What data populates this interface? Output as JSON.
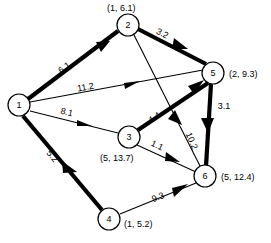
{
  "diagram": {
    "type": "directed-network-graph",
    "title": "",
    "width": 271,
    "height": 243,
    "nodes": [
      {
        "id": "1",
        "label": "1",
        "annotation": "",
        "cx": 19,
        "cy": 105,
        "r": 11
      },
      {
        "id": "2",
        "label": "2",
        "annotation": "(1, 6.1)",
        "cx": 128,
        "cy": 25,
        "r": 11
      },
      {
        "id": "3",
        "label": "3",
        "annotation": "(5, 13.7)",
        "cx": 129,
        "cy": 137,
        "r": 11
      },
      {
        "id": "4",
        "label": "4",
        "annotation": "(1, 5.2)",
        "cx": 109,
        "cy": 219,
        "r": 11
      },
      {
        "id": "5",
        "label": "5",
        "annotation": "(2, 9.3)",
        "cx": 213,
        "cy": 73,
        "r": 11
      },
      {
        "id": "6",
        "label": "6",
        "annotation": "(5, 12.4)",
        "cx": 205,
        "cy": 176,
        "r": 11
      }
    ],
    "edges": [
      {
        "from": "1",
        "to": "2",
        "weight": "6.1",
        "style": "thick",
        "label_x": 66,
        "label_y": 70
      },
      {
        "from": "2",
        "to": "5",
        "weight": "3.2",
        "style": "thick",
        "label_x": 163,
        "label_y": 38
      },
      {
        "from": "1",
        "to": "5",
        "weight": "11.2",
        "style": "thin",
        "label_x": 86,
        "label_y": 92
      },
      {
        "from": "3",
        "to": "1",
        "weight": "8.1",
        "style": "thin",
        "label_x": 66,
        "label_y": 117
      },
      {
        "from": "1",
        "to": "4",
        "weight": "5.2",
        "style": "thick",
        "label_x": 51,
        "label_y": 159
      },
      {
        "from": "3",
        "to": "5",
        "weight": "4.4",
        "style": "thick",
        "label_x": 158,
        "label_y": 121
      },
      {
        "from": "2",
        "to": "6",
        "weight": "10.2",
        "style": "thin",
        "label_x": 188,
        "label_y": 143
      },
      {
        "from": "3",
        "to": "6",
        "weight": "1.1",
        "style": "thin",
        "label_x": 157,
        "label_y": 150
      },
      {
        "from": "5",
        "to": "6",
        "weight": "3.1",
        "style": "thick",
        "label_x": 222,
        "label_y": 107
      },
      {
        "from": "4",
        "to": "6",
        "weight": "9.3",
        "style": "thin",
        "label_x": 161,
        "label_y": 203
      }
    ],
    "annotations": {
      "node2": "(1, 6.1)",
      "node3": "(5, 13.7)",
      "node4": "(1, 5.2)",
      "node5": "(2, 9.3)",
      "node6": "(5, 12.4)"
    },
    "colors": {
      "background": "#ffffff",
      "stroke": "#000000",
      "node_fill": "#ffffff"
    }
  }
}
